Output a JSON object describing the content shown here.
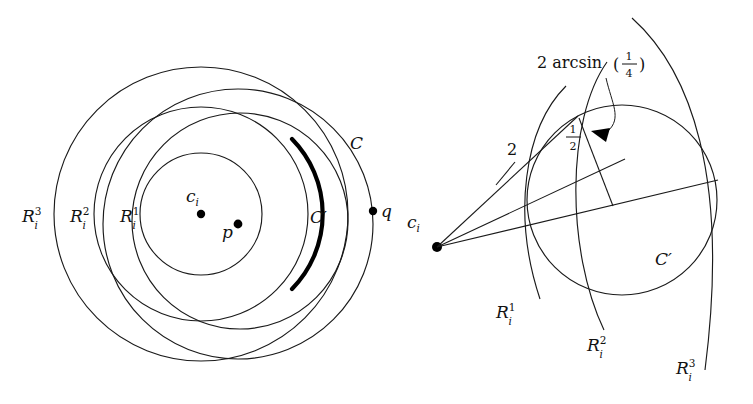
{
  "figure": {
    "panels": [
      {
        "id": "left",
        "name": "concentric-rings-panel",
        "labels": {
          "ring3": "R",
          "ring3_sup": "3",
          "ring3_sub": "i",
          "ring2": "R",
          "ring2_sup": "2",
          "ring2_sub": "i",
          "ring1": "R",
          "ring1_sup": "1",
          "ring1_sub": "i",
          "center": "c",
          "center_sub": "i",
          "point_p": "p",
          "point_q": "q",
          "circle_c": "C",
          "circle_cprime": "C′"
        }
      },
      {
        "id": "right",
        "name": "angle-detail-panel",
        "labels": {
          "center": "c",
          "center_sub": "i",
          "distance_two": "2",
          "half_num": "1",
          "half_den": "2",
          "angle_text": "2 arcsin",
          "angle_paren_open": "(",
          "angle_paren_close": ")",
          "angle_frac_num": "1",
          "angle_frac_den": "4",
          "ring1": "R",
          "ring1_sup": "1",
          "ring1_sub": "i",
          "ring2": "R",
          "ring2_sup": "2",
          "ring2_sub": "i",
          "ring3": "R",
          "ring3_sup": "3",
          "ring3_sub": "i",
          "circle_cprime": "C′"
        }
      }
    ],
    "colors": {
      "stroke": "#1a1a1a",
      "bold_arc": "#000000",
      "background": "#ffffff",
      "text": "#111111"
    }
  }
}
